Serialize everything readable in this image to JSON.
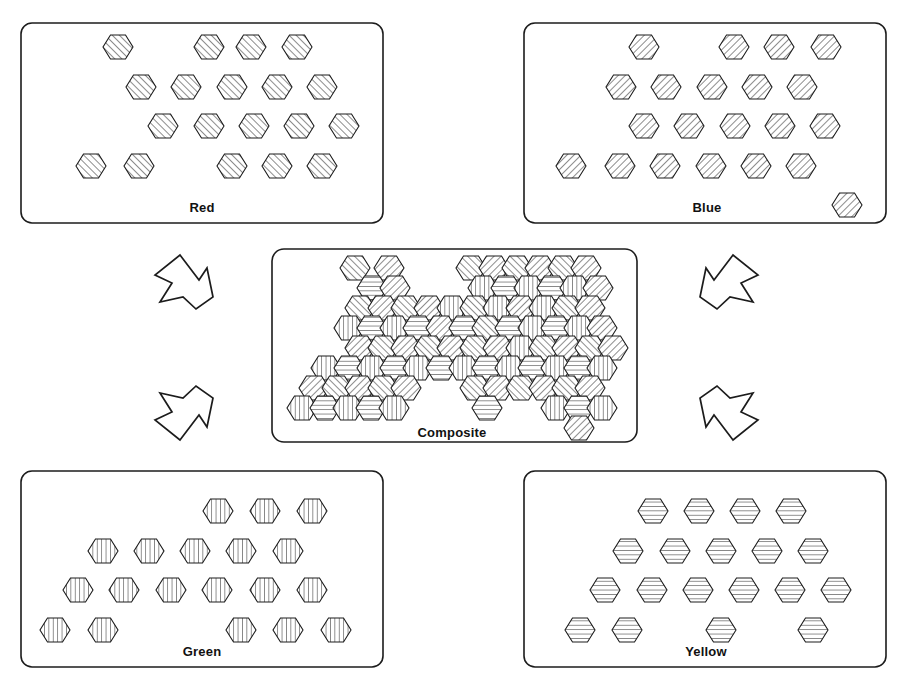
{
  "figure": {
    "background_color": "#ffffff",
    "line_color": "#1c1c1c",
    "width": 911,
    "height": 687
  },
  "panels": [
    {
      "id": "red",
      "label": "Red",
      "hatch": "diagonal-backslash",
      "hatch_angle_deg": 135,
      "box": {
        "x": 21,
        "y": 23,
        "w": 362,
        "h": 200,
        "rx": 11
      },
      "label_pos": {
        "x": 202,
        "y": 212
      },
      "hex_count": 19,
      "hex_radius": 15,
      "hexes": [
        {
          "cx": 118,
          "cy": 47
        },
        {
          "cx": 209,
          "cy": 47
        },
        {
          "cx": 251,
          "cy": 47
        },
        {
          "cx": 297,
          "cy": 47
        },
        {
          "cx": 141,
          "cy": 87
        },
        {
          "cx": 186,
          "cy": 87
        },
        {
          "cx": 232,
          "cy": 87
        },
        {
          "cx": 277,
          "cy": 87
        },
        {
          "cx": 322,
          "cy": 87
        },
        {
          "cx": 163,
          "cy": 126
        },
        {
          "cx": 209,
          "cy": 126
        },
        {
          "cx": 254,
          "cy": 126
        },
        {
          "cx": 299,
          "cy": 126
        },
        {
          "cx": 344,
          "cy": 126
        },
        {
          "cx": 91,
          "cy": 166
        },
        {
          "cx": 139,
          "cy": 166
        },
        {
          "cx": 232,
          "cy": 166
        },
        {
          "cx": 277,
          "cy": 166
        },
        {
          "cx": 322,
          "cy": 166
        }
      ]
    },
    {
      "id": "blue",
      "label": "Blue",
      "hatch": "diagonal-slash",
      "hatch_angle_deg": 45,
      "box": {
        "x": 524,
        "y": 23,
        "w": 362,
        "h": 200,
        "rx": 11
      },
      "label_pos": {
        "x": 707,
        "y": 212
      },
      "hex_count": 22,
      "hex_radius": 15,
      "hexes": [
        {
          "cx": 644,
          "cy": 47
        },
        {
          "cx": 734,
          "cy": 47
        },
        {
          "cx": 779,
          "cy": 47
        },
        {
          "cx": 826,
          "cy": 47
        },
        {
          "cx": 621,
          "cy": 87
        },
        {
          "cx": 666,
          "cy": 87
        },
        {
          "cx": 712,
          "cy": 87
        },
        {
          "cx": 757,
          "cy": 87
        },
        {
          "cx": 802,
          "cy": 87
        },
        {
          "cx": 644,
          "cy": 126
        },
        {
          "cx": 689,
          "cy": 126
        },
        {
          "cx": 735,
          "cy": 126
        },
        {
          "cx": 780,
          "cy": 126
        },
        {
          "cx": 825,
          "cy": 126
        },
        {
          "cx": 571,
          "cy": 166
        },
        {
          "cx": 620,
          "cy": 166
        },
        {
          "cx": 665,
          "cy": 166
        },
        {
          "cx": 711,
          "cy": 166
        },
        {
          "cx": 756,
          "cy": 166
        },
        {
          "cx": 801,
          "cy": 166
        },
        {
          "cx": 847,
          "cy": 205
        }
      ]
    },
    {
      "id": "green",
      "label": "Green",
      "hatch": "vertical",
      "hatch_angle_deg": 90,
      "box": {
        "x": 21,
        "y": 471,
        "w": 362,
        "h": 196,
        "rx": 11
      },
      "label_pos": {
        "x": 202,
        "y": 656
      },
      "hex_count": 19,
      "hex_radius": 15,
      "hexes": [
        {
          "cx": 218,
          "cy": 511
        },
        {
          "cx": 265,
          "cy": 511
        },
        {
          "cx": 312,
          "cy": 511
        },
        {
          "cx": 103,
          "cy": 551
        },
        {
          "cx": 149,
          "cy": 551
        },
        {
          "cx": 195,
          "cy": 551
        },
        {
          "cx": 241,
          "cy": 551
        },
        {
          "cx": 288,
          "cy": 551
        },
        {
          "cx": 78,
          "cy": 590
        },
        {
          "cx": 124,
          "cy": 590
        },
        {
          "cx": 171,
          "cy": 590
        },
        {
          "cx": 217,
          "cy": 590
        },
        {
          "cx": 265,
          "cy": 590
        },
        {
          "cx": 312,
          "cy": 590
        },
        {
          "cx": 55,
          "cy": 630
        },
        {
          "cx": 103,
          "cy": 630
        },
        {
          "cx": 241,
          "cy": 630
        },
        {
          "cx": 288,
          "cy": 630
        },
        {
          "cx": 336,
          "cy": 630
        }
      ]
    },
    {
      "id": "yellow",
      "label": "Yellow",
      "hatch": "horizontal",
      "hatch_angle_deg": 0,
      "box": {
        "x": 524,
        "y": 471,
        "w": 362,
        "h": 196,
        "rx": 11
      },
      "label_pos": {
        "x": 706,
        "y": 656
      },
      "hex_count": 19,
      "hex_radius": 15,
      "hexes": [
        {
          "cx": 653,
          "cy": 511
        },
        {
          "cx": 699,
          "cy": 511
        },
        {
          "cx": 745,
          "cy": 511
        },
        {
          "cx": 791,
          "cy": 511
        },
        {
          "cx": 628,
          "cy": 551
        },
        {
          "cx": 675,
          "cy": 551
        },
        {
          "cx": 721,
          "cy": 551
        },
        {
          "cx": 767,
          "cy": 551
        },
        {
          "cx": 813,
          "cy": 551
        },
        {
          "cx": 605,
          "cy": 590
        },
        {
          "cx": 652,
          "cy": 590
        },
        {
          "cx": 698,
          "cy": 590
        },
        {
          "cx": 744,
          "cy": 590
        },
        {
          "cx": 790,
          "cy": 590
        },
        {
          "cx": 836,
          "cy": 590
        },
        {
          "cx": 580,
          "cy": 630
        },
        {
          "cx": 627,
          "cy": 630
        },
        {
          "cx": 721,
          "cy": 630
        },
        {
          "cx": 813,
          "cy": 630
        }
      ]
    }
  ],
  "composite": {
    "id": "composite",
    "label": "Composite",
    "box": {
      "x": 272,
      "y": 249,
      "w": 365,
      "h": 193,
      "rx": 12
    },
    "label_pos": {
      "x": 452,
      "y": 437
    },
    "hex_radius": 15,
    "hex_count": 79,
    "hexes": [
      {
        "cx": 355,
        "cy": 268,
        "hatch": "diagonal-backslash"
      },
      {
        "cx": 389,
        "cy": 268,
        "hatch": "diagonal-slash"
      },
      {
        "cx": 471,
        "cy": 268,
        "hatch": "diagonal-backslash"
      },
      {
        "cx": 494,
        "cy": 268,
        "hatch": "diagonal-slash"
      },
      {
        "cx": 517,
        "cy": 268,
        "hatch": "diagonal-backslash"
      },
      {
        "cx": 540,
        "cy": 268,
        "hatch": "diagonal-slash"
      },
      {
        "cx": 563,
        "cy": 268,
        "hatch": "diagonal-backslash"
      },
      {
        "cx": 586,
        "cy": 268,
        "hatch": "diagonal-slash"
      },
      {
        "cx": 372,
        "cy": 288,
        "hatch": "horizontal"
      },
      {
        "cx": 395,
        "cy": 288,
        "hatch": "diagonal-slash"
      },
      {
        "cx": 483,
        "cy": 288,
        "hatch": "vertical"
      },
      {
        "cx": 506,
        "cy": 288,
        "hatch": "horizontal"
      },
      {
        "cx": 529,
        "cy": 288,
        "hatch": "vertical"
      },
      {
        "cx": 552,
        "cy": 288,
        "hatch": "horizontal"
      },
      {
        "cx": 575,
        "cy": 288,
        "hatch": "vertical"
      },
      {
        "cx": 598,
        "cy": 288,
        "hatch": "diagonal-slash"
      },
      {
        "cx": 360,
        "cy": 308,
        "hatch": "diagonal-backslash"
      },
      {
        "cx": 383,
        "cy": 308,
        "hatch": "diagonal-slash"
      },
      {
        "cx": 406,
        "cy": 308,
        "hatch": "diagonal-backslash"
      },
      {
        "cx": 429,
        "cy": 308,
        "hatch": "diagonal-slash"
      },
      {
        "cx": 452,
        "cy": 308,
        "hatch": "vertical"
      },
      {
        "cx": 475,
        "cy": 308,
        "hatch": "diagonal-backslash"
      },
      {
        "cx": 498,
        "cy": 308,
        "hatch": "vertical"
      },
      {
        "cx": 521,
        "cy": 308,
        "hatch": "diagonal-slash"
      },
      {
        "cx": 544,
        "cy": 308,
        "hatch": "vertical"
      },
      {
        "cx": 567,
        "cy": 308,
        "hatch": "diagonal-backslash"
      },
      {
        "cx": 590,
        "cy": 308,
        "hatch": "diagonal-slash"
      },
      {
        "cx": 349,
        "cy": 328,
        "hatch": "vertical"
      },
      {
        "cx": 372,
        "cy": 328,
        "hatch": "horizontal"
      },
      {
        "cx": 395,
        "cy": 328,
        "hatch": "vertical"
      },
      {
        "cx": 418,
        "cy": 328,
        "hatch": "horizontal"
      },
      {
        "cx": 441,
        "cy": 328,
        "hatch": "diagonal-slash"
      },
      {
        "cx": 464,
        "cy": 328,
        "hatch": "horizontal"
      },
      {
        "cx": 487,
        "cy": 328,
        "hatch": "diagonal-backslash"
      },
      {
        "cx": 510,
        "cy": 328,
        "hatch": "horizontal"
      },
      {
        "cx": 533,
        "cy": 328,
        "hatch": "vertical"
      },
      {
        "cx": 556,
        "cy": 328,
        "hatch": "horizontal"
      },
      {
        "cx": 579,
        "cy": 328,
        "hatch": "vertical"
      },
      {
        "cx": 602,
        "cy": 328,
        "hatch": "diagonal-slash"
      },
      {
        "cx": 360,
        "cy": 348,
        "hatch": "diagonal-slash"
      },
      {
        "cx": 383,
        "cy": 348,
        "hatch": "diagonal-backslash"
      },
      {
        "cx": 406,
        "cy": 348,
        "hatch": "diagonal-slash"
      },
      {
        "cx": 429,
        "cy": 348,
        "hatch": "diagonal-backslash"
      },
      {
        "cx": 452,
        "cy": 348,
        "hatch": "diagonal-slash"
      },
      {
        "cx": 475,
        "cy": 348,
        "hatch": "diagonal-backslash"
      },
      {
        "cx": 498,
        "cy": 348,
        "hatch": "diagonal-slash"
      },
      {
        "cx": 521,
        "cy": 348,
        "hatch": "vertical"
      },
      {
        "cx": 544,
        "cy": 348,
        "hatch": "diagonal-backslash"
      },
      {
        "cx": 567,
        "cy": 348,
        "hatch": "diagonal-slash"
      },
      {
        "cx": 590,
        "cy": 348,
        "hatch": "diagonal-backslash"
      },
      {
        "cx": 613,
        "cy": 348,
        "hatch": "diagonal-slash"
      },
      {
        "cx": 326,
        "cy": 368,
        "hatch": "vertical"
      },
      {
        "cx": 349,
        "cy": 368,
        "hatch": "horizontal"
      },
      {
        "cx": 372,
        "cy": 368,
        "hatch": "vertical"
      },
      {
        "cx": 395,
        "cy": 368,
        "hatch": "horizontal"
      },
      {
        "cx": 418,
        "cy": 368,
        "hatch": "vertical"
      },
      {
        "cx": 441,
        "cy": 368,
        "hatch": "horizontal"
      },
      {
        "cx": 464,
        "cy": 368,
        "hatch": "vertical"
      },
      {
        "cx": 487,
        "cy": 368,
        "hatch": "horizontal"
      },
      {
        "cx": 510,
        "cy": 368,
        "hatch": "vertical"
      },
      {
        "cx": 533,
        "cy": 368,
        "hatch": "horizontal"
      },
      {
        "cx": 556,
        "cy": 368,
        "hatch": "vertical"
      },
      {
        "cx": 579,
        "cy": 368,
        "hatch": "horizontal"
      },
      {
        "cx": 602,
        "cy": 368,
        "hatch": "vertical"
      },
      {
        "cx": 314,
        "cy": 388,
        "hatch": "diagonal-slash"
      },
      {
        "cx": 337,
        "cy": 388,
        "hatch": "diagonal-backslash"
      },
      {
        "cx": 360,
        "cy": 388,
        "hatch": "diagonal-slash"
      },
      {
        "cx": 383,
        "cy": 388,
        "hatch": "diagonal-backslash"
      },
      {
        "cx": 406,
        "cy": 388,
        "hatch": "diagonal-slash"
      },
      {
        "cx": 475,
        "cy": 388,
        "hatch": "diagonal-backslash"
      },
      {
        "cx": 498,
        "cy": 388,
        "hatch": "diagonal-slash"
      },
      {
        "cx": 521,
        "cy": 388,
        "hatch": "diagonal-backslash"
      },
      {
        "cx": 544,
        "cy": 388,
        "hatch": "diagonal-slash"
      },
      {
        "cx": 567,
        "cy": 388,
        "hatch": "diagonal-backslash"
      },
      {
        "cx": 590,
        "cy": 388,
        "hatch": "diagonal-slash"
      },
      {
        "cx": 302,
        "cy": 408,
        "hatch": "vertical"
      },
      {
        "cx": 325,
        "cy": 408,
        "hatch": "horizontal"
      },
      {
        "cx": 348,
        "cy": 408,
        "hatch": "vertical"
      },
      {
        "cx": 371,
        "cy": 408,
        "hatch": "horizontal"
      },
      {
        "cx": 394,
        "cy": 408,
        "hatch": "vertical"
      },
      {
        "cx": 487,
        "cy": 408,
        "hatch": "horizontal"
      },
      {
        "cx": 556,
        "cy": 408,
        "hatch": "vertical"
      },
      {
        "cx": 579,
        "cy": 408,
        "hatch": "horizontal"
      },
      {
        "cx": 602,
        "cy": 408,
        "hatch": "vertical"
      },
      {
        "cx": 579,
        "cy": 428,
        "hatch": "diagonal-slash"
      }
    ]
  },
  "arrows": [
    {
      "id": "arrow-red-to-composite",
      "direction": "down-right",
      "from": "red",
      "to": "composite",
      "points": "180,255 199,280 207,268 213,297 196,309 183,297 160,302 172,283 155,275"
    },
    {
      "id": "arrow-blue-to-composite",
      "direction": "down-left",
      "from": "blue",
      "to": "composite",
      "points": "733,255 714,280 706,268 700,297 717,309 730,297 753,302 741,283 758,275"
    },
    {
      "id": "arrow-green-to-composite",
      "direction": "up-right",
      "from": "green",
      "to": "composite",
      "points": "180,440 199,415 207,427 213,398 196,386 183,398 160,393 172,412 155,420"
    },
    {
      "id": "arrow-yellow-to-composite",
      "direction": "up-left",
      "from": "yellow",
      "to": "composite",
      "points": "733,440 714,415 706,427 700,398 717,386 730,398 753,393 741,412 758,420"
    }
  ],
  "hatch_legend": {
    "diagonal-backslash": "Red separation — diagonal hatch descending left-to-right",
    "diagonal-slash": "Blue separation — diagonal hatch ascending left-to-right",
    "vertical": "Green separation — vertical hatch",
    "horizontal": "Yellow separation — horizontal hatch"
  }
}
